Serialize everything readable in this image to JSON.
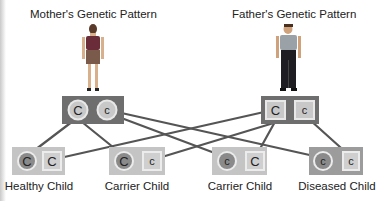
{
  "parents": {
    "mother": {
      "title": "Mother's Genetic Pattern",
      "alleles": [
        "C",
        "c"
      ],
      "allele_shape": "circle"
    },
    "father": {
      "title": "Father's Genetic Pattern",
      "alleles": [
        "C",
        "c"
      ],
      "allele_shape": "square"
    }
  },
  "children": [
    {
      "label": "Healthy Child",
      "alleles": [
        "C",
        "C"
      ]
    },
    {
      "label": "Carrier Child",
      "alleles": [
        "C",
        "c"
      ]
    },
    {
      "label": "Carrier Child",
      "alleles": [
        "c",
        "C"
      ]
    },
    {
      "label": "Diseased Child",
      "alleles": [
        "c",
        "c"
      ]
    }
  ],
  "colors": {
    "parent_box": "#6e6e6e",
    "child_box": "#c4c4c4",
    "allele_fill": "#cfcfcf",
    "mother_child_circle": "#8a8a8a",
    "line": "#555555"
  }
}
